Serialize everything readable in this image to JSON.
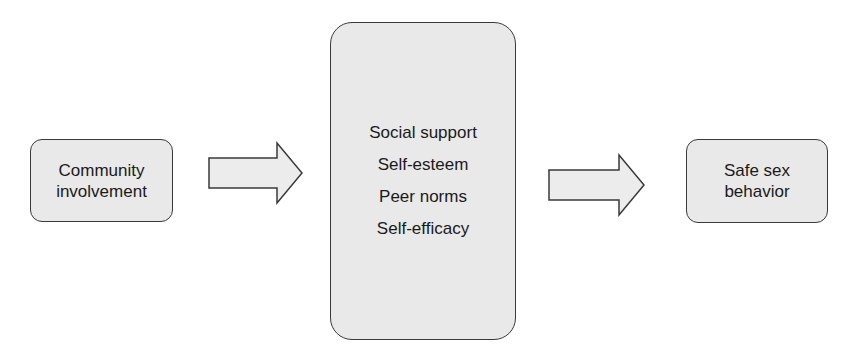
{
  "diagram": {
    "nodes": [
      {
        "id": "community",
        "lines": [
          "Community",
          "involvement"
        ]
      },
      {
        "id": "mediators",
        "items": [
          "Social support",
          "Self-esteem",
          "Peer norms",
          "Self-efficacy"
        ]
      },
      {
        "id": "outcome",
        "lines": [
          "Safe sex",
          "behavior"
        ]
      }
    ],
    "edges": [
      {
        "from": "community",
        "to": "mediators"
      },
      {
        "from": "mediators",
        "to": "outcome"
      }
    ],
    "colors": {
      "fill": "#e9e9e9",
      "stroke": "#3a3a3a",
      "text": "#1a1a1a"
    }
  }
}
